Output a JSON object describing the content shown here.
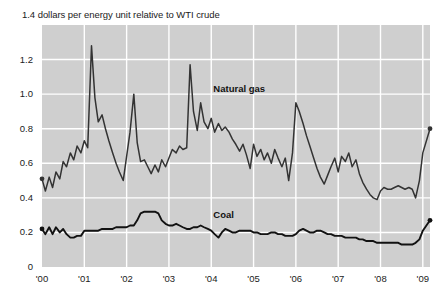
{
  "chart_data": {
    "type": "line",
    "title": "1.4 dollars per energy unit relative to WTI crude",
    "title_note": "The leading \"1.4\" is the topmost y-axis tick label, rendered inline with the axis caption text \"dollars per energy unit relative to WTI crude\".",
    "xlabel": "",
    "ylabel": "dollars per energy unit relative to WTI crude",
    "ylim": [
      0,
      1.4
    ],
    "xlim": [
      2000.0,
      2009.17
    ],
    "grid": true,
    "legend_position": "inline-annotation",
    "plot_background": "#cfcfcf",
    "gridline_color": "#ffffff",
    "line_color": "#333333",
    "y_ticks": [
      0,
      0.2,
      0.4,
      0.6,
      0.8,
      1.0,
      1.2,
      1.4
    ],
    "y_tick_labels": [
      "0",
      "0.2",
      "0.4",
      "0.6",
      "0.8",
      "1.0",
      "1.2",
      "1.4"
    ],
    "x_ticks": [
      2000,
      2001,
      2002,
      2003,
      2004,
      2005,
      2006,
      2007,
      2008,
      2009
    ],
    "x_tick_labels": [
      "'00",
      "'01",
      "'02",
      "'03",
      "'04",
      "'05",
      "'06",
      "'07",
      "'08",
      "'09"
    ],
    "series": [
      {
        "name": "Natural gas",
        "label": "Natural gas",
        "color": "#333333",
        "annotation_x": 2004.05,
        "annotation_y": 1.03,
        "start_marker": true,
        "end_marker": true,
        "x": [
          2000.0,
          2000.08,
          2000.17,
          2000.25,
          2000.33,
          2000.42,
          2000.5,
          2000.58,
          2000.67,
          2000.75,
          2000.83,
          2000.92,
          2001.0,
          2001.08,
          2001.17,
          2001.25,
          2001.33,
          2001.42,
          2001.5,
          2001.58,
          2001.67,
          2001.75,
          2001.83,
          2001.92,
          2002.0,
          2002.08,
          2002.17,
          2002.25,
          2002.33,
          2002.42,
          2002.5,
          2002.58,
          2002.67,
          2002.75,
          2002.83,
          2002.92,
          2003.0,
          2003.08,
          2003.17,
          2003.25,
          2003.33,
          2003.42,
          2003.5,
          2003.58,
          2003.67,
          2003.75,
          2003.83,
          2003.92,
          2004.0,
          2004.08,
          2004.17,
          2004.25,
          2004.33,
          2004.42,
          2004.5,
          2004.58,
          2004.67,
          2004.75,
          2004.83,
          2004.92,
          2005.0,
          2005.08,
          2005.17,
          2005.25,
          2005.33,
          2005.42,
          2005.5,
          2005.58,
          2005.67,
          2005.75,
          2005.83,
          2005.92,
          2006.0,
          2006.08,
          2006.17,
          2006.25,
          2006.33,
          2006.42,
          2006.5,
          2006.58,
          2006.67,
          2006.75,
          2006.83,
          2006.92,
          2007.0,
          2007.08,
          2007.17,
          2007.25,
          2007.33,
          2007.42,
          2007.5,
          2007.58,
          2007.67,
          2007.75,
          2007.83,
          2007.92,
          2008.0,
          2008.08,
          2008.17,
          2008.25,
          2008.33,
          2008.42,
          2008.5,
          2008.58,
          2008.67,
          2008.75,
          2008.83,
          2008.92,
          2009.0,
          2009.17
        ],
        "y": [
          0.51,
          0.44,
          0.52,
          0.46,
          0.55,
          0.51,
          0.61,
          0.58,
          0.66,
          0.62,
          0.7,
          0.66,
          0.73,
          0.69,
          1.28,
          0.98,
          0.84,
          0.88,
          0.8,
          0.73,
          0.66,
          0.6,
          0.55,
          0.5,
          0.64,
          0.78,
          1.0,
          0.72,
          0.61,
          0.62,
          0.58,
          0.54,
          0.59,
          0.55,
          0.62,
          0.58,
          0.63,
          0.68,
          0.66,
          0.7,
          0.68,
          0.69,
          1.17,
          0.9,
          0.79,
          0.95,
          0.84,
          0.8,
          0.86,
          0.78,
          0.83,
          0.79,
          0.81,
          0.78,
          0.74,
          0.71,
          0.67,
          0.71,
          0.65,
          0.57,
          0.71,
          0.64,
          0.68,
          0.62,
          0.66,
          0.6,
          0.68,
          0.63,
          0.58,
          0.63,
          0.5,
          0.66,
          0.95,
          0.9,
          0.83,
          0.76,
          0.7,
          0.63,
          0.57,
          0.52,
          0.48,
          0.53,
          0.58,
          0.63,
          0.55,
          0.64,
          0.61,
          0.66,
          0.58,
          0.62,
          0.54,
          0.49,
          0.45,
          0.42,
          0.4,
          0.39,
          0.44,
          0.46,
          0.45,
          0.45,
          0.46,
          0.47,
          0.46,
          0.45,
          0.46,
          0.45,
          0.4,
          0.5,
          0.66,
          0.8
        ]
      },
      {
        "name": "Coal",
        "label": "Coal",
        "color": "#121212",
        "annotation_x": 2004.05,
        "annotation_y": 0.3,
        "start_marker": true,
        "end_marker": true,
        "x": [
          2000.0,
          2000.08,
          2000.17,
          2000.25,
          2000.33,
          2000.42,
          2000.5,
          2000.58,
          2000.67,
          2000.75,
          2000.83,
          2000.92,
          2001.0,
          2001.08,
          2001.17,
          2001.25,
          2001.33,
          2001.42,
          2001.5,
          2001.58,
          2001.67,
          2001.75,
          2001.83,
          2001.92,
          2002.0,
          2002.08,
          2002.17,
          2002.25,
          2002.33,
          2002.42,
          2002.5,
          2002.58,
          2002.67,
          2002.75,
          2002.83,
          2002.92,
          2003.0,
          2003.08,
          2003.17,
          2003.25,
          2003.33,
          2003.42,
          2003.5,
          2003.58,
          2003.67,
          2003.75,
          2003.83,
          2003.92,
          2004.0,
          2004.08,
          2004.17,
          2004.25,
          2004.33,
          2004.42,
          2004.5,
          2004.58,
          2004.67,
          2004.75,
          2004.83,
          2004.92,
          2005.0,
          2005.08,
          2005.17,
          2005.25,
          2005.33,
          2005.42,
          2005.5,
          2005.58,
          2005.67,
          2005.75,
          2005.83,
          2005.92,
          2006.0,
          2006.08,
          2006.17,
          2006.25,
          2006.33,
          2006.42,
          2006.5,
          2006.58,
          2006.67,
          2006.75,
          2006.83,
          2006.92,
          2007.0,
          2007.08,
          2007.17,
          2007.25,
          2007.33,
          2007.42,
          2007.5,
          2007.58,
          2007.67,
          2007.75,
          2007.83,
          2007.92,
          2008.0,
          2008.08,
          2008.17,
          2008.25,
          2008.33,
          2008.42,
          2008.5,
          2008.58,
          2008.67,
          2008.75,
          2008.83,
          2008.92,
          2009.0,
          2009.17
        ],
        "y": [
          0.22,
          0.19,
          0.23,
          0.19,
          0.23,
          0.2,
          0.22,
          0.19,
          0.17,
          0.17,
          0.18,
          0.18,
          0.21,
          0.21,
          0.21,
          0.21,
          0.21,
          0.22,
          0.22,
          0.22,
          0.22,
          0.23,
          0.23,
          0.23,
          0.23,
          0.24,
          0.24,
          0.27,
          0.31,
          0.32,
          0.32,
          0.32,
          0.32,
          0.31,
          0.27,
          0.25,
          0.24,
          0.24,
          0.25,
          0.24,
          0.23,
          0.22,
          0.22,
          0.23,
          0.23,
          0.24,
          0.23,
          0.22,
          0.21,
          0.19,
          0.17,
          0.2,
          0.22,
          0.21,
          0.2,
          0.2,
          0.21,
          0.21,
          0.21,
          0.21,
          0.2,
          0.2,
          0.19,
          0.19,
          0.19,
          0.2,
          0.2,
          0.19,
          0.19,
          0.18,
          0.18,
          0.18,
          0.19,
          0.21,
          0.22,
          0.21,
          0.2,
          0.2,
          0.21,
          0.21,
          0.2,
          0.19,
          0.19,
          0.18,
          0.18,
          0.18,
          0.17,
          0.17,
          0.17,
          0.17,
          0.16,
          0.16,
          0.15,
          0.15,
          0.15,
          0.14,
          0.14,
          0.14,
          0.14,
          0.14,
          0.14,
          0.14,
          0.13,
          0.13,
          0.13,
          0.13,
          0.14,
          0.16,
          0.21,
          0.27
        ]
      }
    ]
  }
}
